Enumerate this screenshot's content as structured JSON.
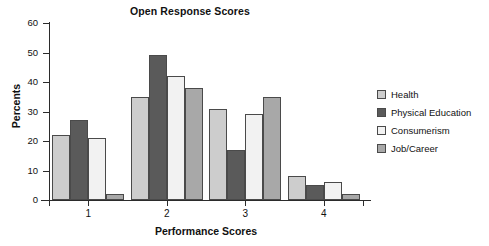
{
  "chart_data": {
    "type": "bar",
    "title": "Open Response Scores",
    "xlabel": "Performance Scores",
    "ylabel": "Percents",
    "categories": [
      "1",
      "2",
      "3",
      "4"
    ],
    "ylim": [
      0,
      60
    ],
    "yticks": [
      0,
      10,
      20,
      30,
      40,
      50,
      60
    ],
    "ytick_labels": [
      "0",
      "10",
      "20",
      "30",
      "40",
      "50",
      "60"
    ],
    "grid": false,
    "legend_position": "right",
    "series": [
      {
        "name": "Health",
        "color": "#cdcdcd",
        "values": [
          22,
          35,
          31,
          8
        ]
      },
      {
        "name": "Physical Education",
        "color": "#5a5a5a",
        "values": [
          27,
          49,
          17,
          5
        ]
      },
      {
        "name": "Consumerism",
        "color": "#f2f2f2",
        "values": [
          21,
          42,
          29,
          6
        ]
      },
      {
        "name": "Job/Career",
        "color": "#a8a8a8",
        "values": [
          2,
          38,
          35,
          2
        ]
      }
    ]
  },
  "axis": {
    "line_color": "#2b2b2b",
    "bar_outline": "#4a4a4a"
  }
}
